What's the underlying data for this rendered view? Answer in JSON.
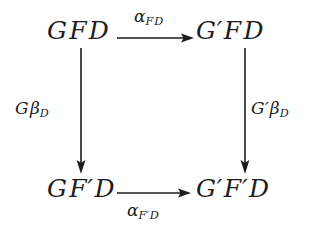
{
  "figure": {
    "kind": "commutative-diagram",
    "background_color": "#ffffff",
    "ink_color": "#1d1d20"
  },
  "nodes": {
    "top_left": {
      "id": "GFD",
      "base1": "G",
      "prime1": "",
      "base2": "F",
      "prime2": "",
      "object": "D"
    },
    "top_right": {
      "id": "G'FD",
      "base1": "G",
      "prime1": "′",
      "base2": "F",
      "prime2": "",
      "object": "D"
    },
    "bottom_left": {
      "id": "GF'D",
      "base1": "G",
      "prime1": "",
      "base2": "F",
      "prime2": "′",
      "object": "D"
    },
    "bottom_right": {
      "id": "G'F'D",
      "base1": "G",
      "prime1": "′",
      "base2": "F",
      "prime2": "′",
      "object": "D"
    }
  },
  "arrows": {
    "top": {
      "name": "alpha-FD",
      "direction": "right",
      "label_symbol": "α",
      "label_subscript_base": "F",
      "label_subscript_prime": "",
      "label_subscript_object": "D",
      "label_plain": "α_FD",
      "label_position": "above"
    },
    "bottom": {
      "name": "alpha-F'D",
      "direction": "right",
      "label_symbol": "α",
      "label_subscript_base": "F",
      "label_subscript_prime": "′",
      "label_subscript_object": "D",
      "label_plain": "α_F'D",
      "label_position": "below"
    },
    "left": {
      "name": "G-beta-D",
      "direction": "down",
      "label_base": "G",
      "label_prime": "",
      "label_symbol": "β",
      "label_subscript": "D",
      "label_plain": "Gβ_D",
      "label_position": "left"
    },
    "right": {
      "name": "G'-beta-D",
      "direction": "down",
      "label_base": "G",
      "label_prime": "′",
      "label_symbol": "β",
      "label_subscript": "D",
      "label_plain": "G′β_D",
      "label_position": "right"
    }
  }
}
